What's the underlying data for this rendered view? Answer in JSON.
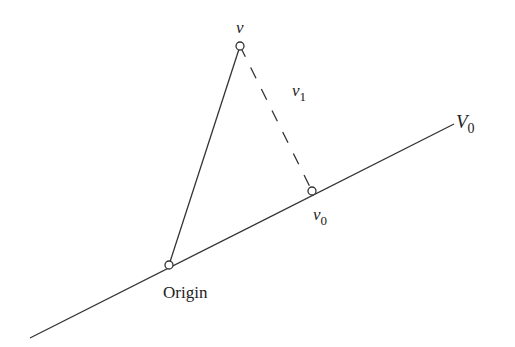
{
  "diagram": {
    "title": "",
    "points": {
      "v": {
        "label": "v",
        "x": 240,
        "y": 46
      },
      "v0": {
        "label": "v",
        "sub": "0",
        "x": 312,
        "y": 191
      },
      "origin": {
        "label": "Origin",
        "x": 169,
        "y": 265
      }
    },
    "line_V0": {
      "label": "V",
      "sub": "0",
      "x1": 30,
      "y1": 338,
      "x2": 454,
      "y2": 124
    },
    "segment_v1": {
      "label": "v",
      "sub": "1",
      "style": "dashed"
    },
    "colors": {
      "line": "#333333",
      "text": "#222222",
      "background": "#ffffff"
    }
  }
}
